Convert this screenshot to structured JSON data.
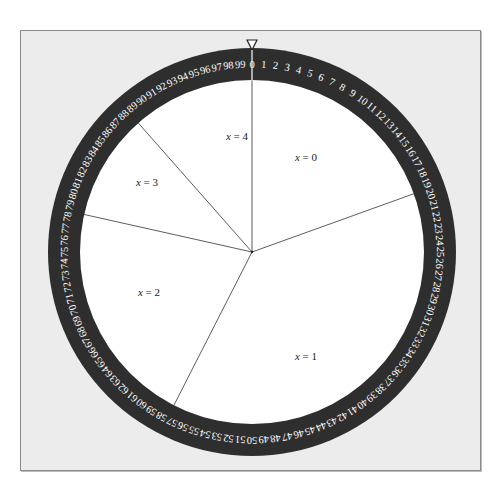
{
  "caption_fragment": "",
  "wheel": {
    "center": [
      252,
      252
    ],
    "outer_radius": 204,
    "inner_radius": 172,
    "ring_color": "#2e2e2e",
    "disc_color": "#ffffff",
    "line_color": "#333333",
    "scale_min": 0,
    "scale_max": 99,
    "scale_divisions": 100,
    "pointer": {
      "position": 0,
      "label": "pointer-triangle"
    },
    "boundaries": [
      0,
      19.5,
      57.5,
      78.5,
      88.5
    ],
    "sectors": [
      {
        "label": "x = 0",
        "var": "x",
        "value": "0",
        "from": 0,
        "to": 19.5,
        "label_pos": [
          306,
          161
        ]
      },
      {
        "label": "x = 1",
        "var": "x",
        "value": "1",
        "from": 19.5,
        "to": 57.5,
        "label_pos": [
          306,
          360
        ]
      },
      {
        "label": "x = 2",
        "var": "x",
        "value": "2",
        "from": 57.5,
        "to": 78.5,
        "label_pos": [
          149,
          296
        ]
      },
      {
        "label": "x = 3",
        "var": "x",
        "value": "3",
        "from": 78.5,
        "to": 88.5,
        "label_pos": [
          147,
          186
        ]
      },
      {
        "label": "x = 4",
        "var": "x",
        "value": "4",
        "from": 88.5,
        "to": 100,
        "label_pos": [
          237,
          140
        ]
      }
    ]
  }
}
